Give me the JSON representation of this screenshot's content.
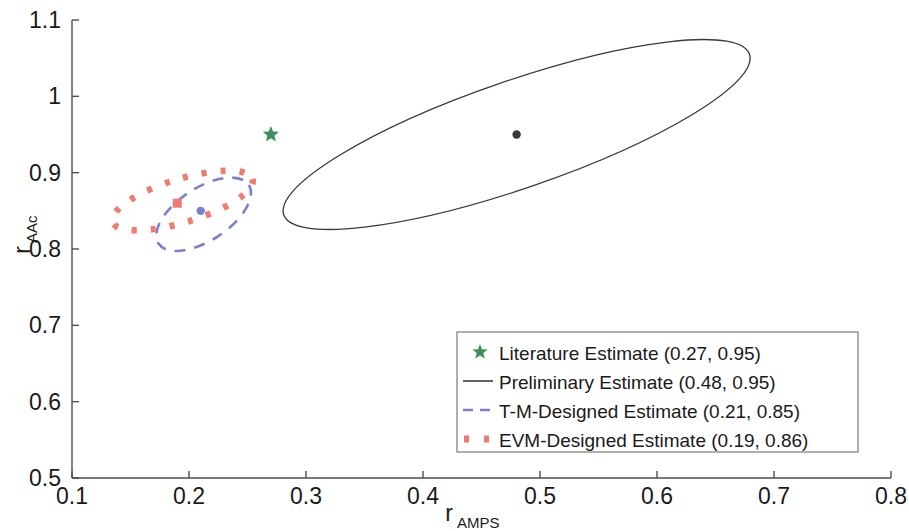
{
  "chart_data": {
    "type": "scatter",
    "title": "",
    "xlabel": "r_AMPS",
    "xlabel_base": "r",
    "xlabel_sub": "AMPS",
    "ylabel": "r_AAc",
    "ylabel_base": "r",
    "ylabel_sub": "AAc",
    "xlim": [
      0.1,
      0.8
    ],
    "ylim": [
      0.5,
      1.1
    ],
    "xticks": [
      "0.1",
      "0.2",
      "0.3",
      "0.4",
      "0.5",
      "0.6",
      "0.7",
      "0.8"
    ],
    "xtick_values": [
      0.1,
      0.2,
      0.3,
      0.4,
      0.5,
      0.6,
      0.7,
      0.8
    ],
    "yticks": [
      "0.5",
      "0.6",
      "0.7",
      "0.8",
      "0.9",
      "1",
      "1.1"
    ],
    "ytick_values": [
      0.5,
      0.6,
      0.7,
      0.8,
      0.9,
      1.0,
      1.1
    ],
    "grid": false,
    "legend_position": "lower-right",
    "series": [
      {
        "name": "Literature Estimate (0.27, 0.95)",
        "marker": "star",
        "color": "#3f8f5e",
        "point": [
          0.27,
          0.95
        ],
        "ellipse": null
      },
      {
        "name": "Preliminary Estimate (0.48, 0.95)",
        "marker": "dot",
        "color": "#3a3a3a",
        "linestyle": "solid",
        "point": [
          0.48,
          0.95
        ],
        "ellipse": {
          "cx": 0.48,
          "cy": 0.95,
          "rx": 0.2105,
          "ry": 0.0705,
          "angle": -19.0
        }
      },
      {
        "name": "T-M-Designed Estimate (0.21, 0.85)",
        "marker": "dot",
        "color": "#7b7fd4",
        "linestyle": "dashed",
        "point": [
          0.21,
          0.85
        ],
        "ellipse": {
          "cx": 0.2125,
          "cy": 0.8455,
          "rx": 0.046,
          "ry": 0.0345,
          "angle": -33.0
        }
      },
      {
        "name": "EVM-Designed Estimate (0.19, 0.86)",
        "marker": "square",
        "color": "#f07a70",
        "linestyle": "dotted",
        "point": [
          0.19,
          0.86
        ],
        "ellipse": {
          "cx": 0.1945,
          "cy": 0.8635,
          "rx": 0.0625,
          "ry": 0.0285,
          "angle": -17.0
        }
      }
    ],
    "annotations": []
  },
  "legend": {
    "entries": [
      {
        "label": "Literature Estimate (0.27, 0.95)",
        "key": "literature"
      },
      {
        "label": "Preliminary Estimate (0.48, 0.95)",
        "key": "preliminary"
      },
      {
        "label": "T-M-Designed Estimate (0.21, 0.85)",
        "key": "tm-designed"
      },
      {
        "label": "EVM-Designed Estimate (0.19, 0.86)",
        "key": "evm-designed"
      }
    ]
  },
  "colors": {
    "literature_green": "#3f8f5e",
    "preliminary_black": "#3a3a3a",
    "tm_blue": "#7b7fd4",
    "evm_red": "#f07a70",
    "axis_gray": "#4d4d4d",
    "background": "#ffffff"
  }
}
